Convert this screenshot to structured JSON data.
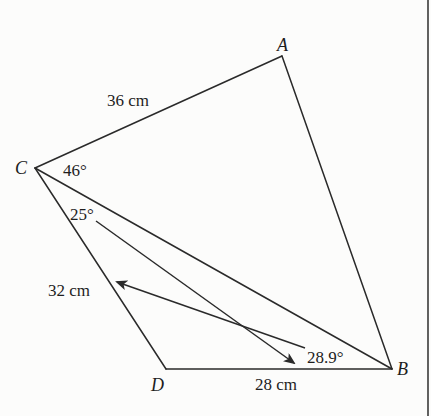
{
  "diagram": {
    "type": "quadrilateral-with-diagonal",
    "vertices": {
      "A": {
        "label": "A",
        "x": 282,
        "y": 56
      },
      "B": {
        "label": "B",
        "x": 392,
        "y": 369
      },
      "C": {
        "label": "C",
        "x": 35,
        "y": 168
      },
      "D": {
        "label": "D",
        "x": 166,
        "y": 369
      }
    },
    "edges": [
      {
        "from": "C",
        "to": "A",
        "length_label": "36 cm"
      },
      {
        "from": "A",
        "to": "B",
        "length_label": ""
      },
      {
        "from": "C",
        "to": "B",
        "length_label": ""
      },
      {
        "from": "C",
        "to": "D",
        "length_label": "32 cm"
      },
      {
        "from": "D",
        "to": "B",
        "length_label": "28 cm"
      }
    ],
    "labels": {
      "side_CA": "36 cm",
      "side_CD": "32 cm",
      "side_DB": "28 cm",
      "angle_ACB": "46°",
      "angle_BCD": "25°",
      "angle_CBD": "28.9°"
    },
    "annotations": [
      {
        "type": "arrow",
        "from_label": "25°",
        "points_to": "angle near B / side DB"
      },
      {
        "type": "arrow",
        "from_label": "28.9°",
        "points_to": "side CD (32 cm)"
      }
    ],
    "colors": {
      "ink": "#2a2a2a",
      "background": "#fcfcfb",
      "border": "#3a3a3a"
    }
  }
}
